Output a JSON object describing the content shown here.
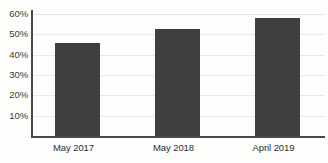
{
  "chart_data": {
    "type": "bar",
    "title": "",
    "subtitle": "",
    "xlabel": "",
    "ylabel": "",
    "categories": [
      "May 2017",
      "May 2018",
      "April 2019"
    ],
    "values": [
      45.5,
      52.5,
      58
    ],
    "value_labels": [
      "",
      "",
      ""
    ],
    "ylim": [
      0,
      63
    ],
    "y_ticks": [
      10,
      20,
      30,
      40,
      50,
      60
    ],
    "y_tick_labels": [
      "10%",
      "20%",
      "30%",
      "40%",
      "50%",
      "60%"
    ],
    "grid": true,
    "grid_axis": "y",
    "legend": false,
    "legend_position": "none",
    "bar_color": "#3f3f3f",
    "grid_color": "#e9e9e7",
    "axis_color": "#4a4a4a",
    "background_color": "#fdfdfc"
  }
}
